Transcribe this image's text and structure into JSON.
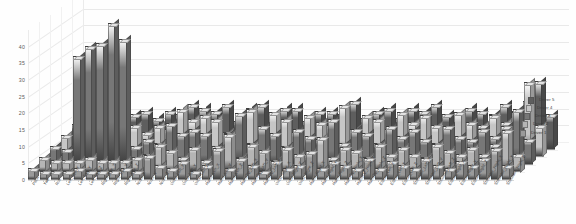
{
  "chart_data": {
    "type": "bar",
    "title": "",
    "subtitle": "",
    "xlabel": "",
    "ylabel": "",
    "ylim": [
      0,
      45
    ],
    "yticks": [
      0,
      5,
      10,
      15,
      20,
      25,
      30,
      35,
      40
    ],
    "grid": true,
    "legend_position": "bottom-right",
    "projection": "3d",
    "depth_axis_name": "Driver",
    "categories": [
      "Pitch",
      "Yaw",
      "Roll",
      "Left_Eye_X",
      "Left_Eye_Y",
      "Left_Eye_Z",
      "Right_Eye_X",
      "Right_Eye_Y",
      "Right_Eye_Z",
      "Nose_X",
      "Nose_Y",
      "Nose_Z",
      "Wrist_Left_X",
      "Wrist_Left_Y",
      "Wrist_Left_Z",
      "Hand_Left_X",
      "Hand_Left_Y",
      "Hand_Left_Z",
      "HandTip_Left_X",
      "HandTip_Left_Y",
      "HandTip_Left_Z",
      "Wrist_Right_X",
      "Wrist_Right_Y",
      "Wrist_Right_Z",
      "Hand_Right_X",
      "Hand_Right_Y",
      "Hand_Right_Z",
      "HandTip_Right_X",
      "HandTip_Right_Y",
      "HandTip_Right_Z",
      "Elbow_Left_X",
      "Elbow_Left_Y",
      "Elbow_Left_Z",
      "Shoulder_Left_X",
      "Shoulder_Left_Y",
      "Shoulder_Left_Z",
      "Elbow_Right_X",
      "Elbow_Right_Y",
      "Elbow_Right_Z",
      "Shoulder_Right_X",
      "Shoulder_Right_Y",
      "Shoulder_Right_Z"
    ],
    "series": [
      {
        "name": "Driver 1",
        "color": "#9a9a9a",
        "values": [
          3,
          2,
          2,
          2,
          3,
          2,
          2,
          2,
          3,
          2,
          7,
          4,
          3,
          5,
          2,
          4,
          9,
          3,
          6,
          4,
          2,
          5,
          3,
          4,
          8,
          3,
          5,
          4,
          3,
          6,
          3,
          5,
          4,
          3,
          6,
          4,
          3,
          5,
          4,
          6,
          9,
          4
        ]
      },
      {
        "name": "Driver 2",
        "color": "#b5b5b5",
        "values": [
          4,
          3,
          3,
          3,
          4,
          3,
          3,
          3,
          4,
          5,
          8,
          6,
          4,
          7,
          3,
          6,
          11,
          4,
          8,
          6,
          3,
          7,
          5,
          5,
          10,
          4,
          7,
          6,
          4,
          8,
          5,
          7,
          5,
          4,
          8,
          6,
          5,
          7,
          5,
          8,
          12,
          5
        ]
      },
      {
        "name": "Driver 3",
        "color": "#777777",
        "values": [
          5,
          4,
          32,
          35,
          36,
          42,
          37,
          5,
          7,
          6,
          12,
          9,
          10,
          9,
          5,
          9,
          15,
          6,
          11,
          9,
          5,
          10,
          8,
          7,
          13,
          6,
          10,
          9,
          6,
          11,
          8,
          10,
          7,
          6,
          11,
          8,
          7,
          10,
          8,
          11,
          16,
          7
        ]
      },
      {
        "name": "Driver 4",
        "color": "#c6c6c6",
        "values": [
          6,
          5,
          8,
          7,
          9,
          8,
          9,
          7,
          9,
          8,
          14,
          11,
          12,
          11,
          7,
          11,
          14,
          8,
          13,
          11,
          7,
          12,
          10,
          9,
          15,
          8,
          12,
          11,
          8,
          13,
          10,
          12,
          9,
          8,
          13,
          10,
          9,
          12,
          10,
          13,
          22,
          9
        ]
      },
      {
        "name": "Driver 5",
        "color": "#5e5e5e",
        "values": [
          7,
          6,
          10,
          9,
          11,
          10,
          11,
          9,
          11,
          10,
          13,
          12,
          11,
          13,
          8,
          12,
          13,
          9,
          12,
          12,
          8,
          11,
          11,
          10,
          14,
          9,
          11,
          12,
          9,
          12,
          11,
          13,
          10,
          9,
          12,
          11,
          10,
          13,
          11,
          14,
          20,
          10
        ]
      }
    ]
  },
  "legend": {
    "items": [
      {
        "label": "Driver 5"
      },
      {
        "label": "Driver 4"
      },
      {
        "label": "Driver 3"
      },
      {
        "label": "Driver 2"
      },
      {
        "label": "Driver 1"
      }
    ]
  }
}
